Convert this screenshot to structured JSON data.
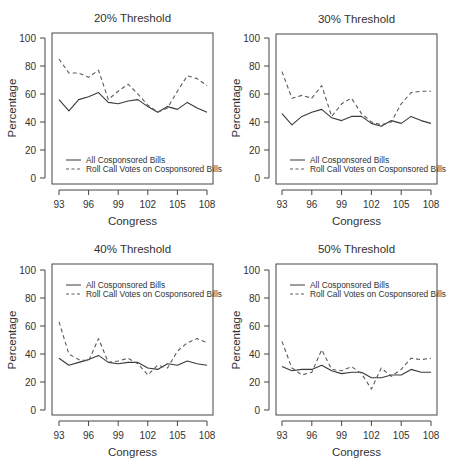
{
  "figure": {
    "layout": "2x2 grid of line charts",
    "ink_color": "#444444",
    "solid_color": "#3a3a3a",
    "dashed_color": "#5a5a5a"
  },
  "chart_data": [
    {
      "type": "line",
      "title": "20% Threshold",
      "xlabel": "Congress",
      "ylabel": "Percentage",
      "ylim": [
        0,
        100
      ],
      "yticks": [
        0,
        20,
        40,
        60,
        80,
        100
      ],
      "xticks": [
        93,
        96,
        99,
        102,
        105,
        108
      ],
      "grid": false,
      "legend_position": "bottom-left inside",
      "x": [
        93,
        94,
        95,
        96,
        97,
        98,
        99,
        100,
        101,
        102,
        103,
        104,
        105,
        106,
        107,
        108
      ],
      "series": [
        {
          "name": "All Cosponsored Bills",
          "style": "solid",
          "values": [
            56,
            48,
            56,
            58,
            61,
            54,
            53,
            55,
            56,
            51,
            47,
            51,
            49,
            54,
            50,
            47
          ]
        },
        {
          "name": "Roll Call Votes on Cosponsored Bills",
          "style": "dashed",
          "values": [
            85,
            75,
            75,
            72,
            77,
            56,
            62,
            67,
            60,
            52,
            47,
            50,
            62,
            73,
            71,
            66
          ]
        }
      ]
    },
    {
      "type": "line",
      "title": "30% Threshold",
      "xlabel": "Congress",
      "ylabel": "Percentage",
      "ylim": [
        0,
        100
      ],
      "yticks": [
        0,
        20,
        40,
        60,
        80,
        100
      ],
      "xticks": [
        93,
        96,
        99,
        102,
        105,
        108
      ],
      "grid": false,
      "legend_position": "bottom-left inside",
      "x": [
        93,
        94,
        95,
        96,
        97,
        98,
        99,
        100,
        101,
        102,
        103,
        104,
        105,
        106,
        107,
        108
      ],
      "series": [
        {
          "name": "All Cosponsored Bills",
          "style": "solid",
          "values": [
            46,
            38,
            44,
            47,
            49,
            43,
            41,
            44,
            44,
            39,
            37,
            41,
            39,
            44,
            41,
            39
          ]
        },
        {
          "name": "Roll Call Votes on Cosponsored Bills",
          "style": "dashed",
          "values": [
            76,
            57,
            59,
            57,
            66,
            44,
            53,
            57,
            46,
            40,
            38,
            40,
            53,
            61,
            62,
            62
          ]
        }
      ]
    },
    {
      "type": "line",
      "title": "40% Threshold",
      "xlabel": "Congress",
      "ylabel": "Percentage",
      "ylim": [
        0,
        100
      ],
      "yticks": [
        0,
        20,
        40,
        60,
        80,
        100
      ],
      "xticks": [
        93,
        96,
        99,
        102,
        105,
        108
      ],
      "grid": false,
      "legend_position": "top-left inside",
      "x": [
        93,
        94,
        95,
        96,
        97,
        98,
        99,
        100,
        101,
        102,
        103,
        104,
        105,
        106,
        107,
        108
      ],
      "series": [
        {
          "name": "All Cosponsored Bills",
          "style": "solid",
          "values": [
            37,
            32,
            34,
            36,
            39,
            34,
            33,
            34,
            34,
            30,
            29,
            33,
            32,
            35,
            33,
            32
          ]
        },
        {
          "name": "Roll Call Votes on Cosponsored Bills",
          "style": "dashed",
          "values": [
            63,
            40,
            36,
            35,
            51,
            34,
            35,
            37,
            33,
            25,
            32,
            30,
            42,
            48,
            51,
            48
          ]
        }
      ]
    },
    {
      "type": "line",
      "title": "50% Threshold",
      "xlabel": "Congress",
      "ylabel": "Percentage",
      "ylim": [
        0,
        100
      ],
      "yticks": [
        0,
        20,
        40,
        60,
        80,
        100
      ],
      "xticks": [
        93,
        96,
        99,
        102,
        105,
        108
      ],
      "grid": false,
      "legend_position": "top-left inside",
      "x": [
        93,
        94,
        95,
        96,
        97,
        98,
        99,
        100,
        101,
        102,
        103,
        104,
        105,
        106,
        107,
        108
      ],
      "series": [
        {
          "name": "All Cosponsored Bills",
          "style": "solid",
          "values": [
            31,
            28,
            29,
            29,
            32,
            28,
            26,
            27,
            27,
            23,
            23,
            25,
            25,
            29,
            27,
            27
          ]
        },
        {
          "name": "Roll Call Votes on Cosponsored Bills",
          "style": "dashed",
          "values": [
            49,
            30,
            25,
            27,
            43,
            29,
            28,
            31,
            26,
            15,
            30,
            24,
            29,
            37,
            36,
            37
          ]
        }
      ]
    }
  ]
}
